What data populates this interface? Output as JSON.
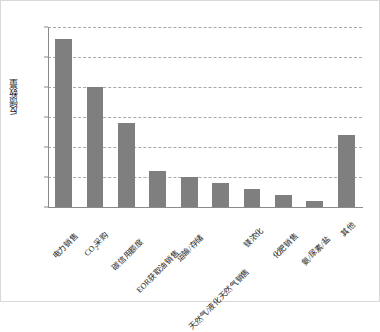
{
  "chart_data": {
    "type": "bar",
    "title": "",
    "xlabel": "",
    "ylabel": "反馈数量",
    "ylim": [
      0,
      30
    ],
    "ytick_step": 5,
    "yticks": [
      "0",
      "5",
      "10",
      "15",
      "20",
      "25",
      "30"
    ],
    "grid": true,
    "legend": "none",
    "bar_color": "#7f7f7f",
    "categories": [
      "电力销售",
      "CO₂采购",
      "碳信用额度",
      "EOR获取油销售",
      "运输/存储",
      "天然气/液化天然气销售",
      "镁浓化",
      "化肥销售",
      "氨/尿素/盐",
      "其他"
    ],
    "values": [
      28,
      20,
      14,
      6,
      5,
      4,
      3,
      2,
      1,
      12
    ]
  },
  "axis": {
    "y_title": "反馈数量"
  }
}
